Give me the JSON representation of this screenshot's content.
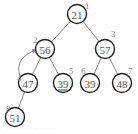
{
  "diagram": {
    "type": "binary-heap",
    "nodes": [
      {
        "index": "1",
        "value": "21",
        "x": 77,
        "y": 14,
        "lx": 85,
        "ly": 9
      },
      {
        "index": "2",
        "value": "56",
        "x": 45,
        "y": 49,
        "lx": 33,
        "ly": 43
      },
      {
        "index": "3",
        "value": "57",
        "x": 105,
        "y": 49,
        "lx": 111,
        "ly": 37
      },
      {
        "index": "4",
        "value": "47",
        "x": 28,
        "y": 83,
        "lx": 17,
        "ly": 81
      },
      {
        "index": "5",
        "value": "39",
        "x": 63,
        "y": 83,
        "lx": 69,
        "ly": 74,
        "underline": true
      },
      {
        "index": "6",
        "value": "39",
        "x": 90,
        "y": 83,
        "lx": 81,
        "ly": 74
      },
      {
        "index": "7",
        "value": "48",
        "x": 122,
        "y": 83,
        "lx": 128,
        "ly": 74
      },
      {
        "index": "8",
        "value": "51",
        "x": 15,
        "y": 117,
        "lx": 6,
        "ly": 112
      }
    ],
    "edges": [
      [
        0,
        1
      ],
      [
        0,
        2
      ],
      [
        1,
        3
      ],
      [
        1,
        4
      ],
      [
        2,
        5
      ],
      [
        2,
        6
      ],
      [
        3,
        7
      ]
    ],
    "swap_arrow": {
      "from": "4",
      "to": "2"
    },
    "caption": "·· ··· ·· · ··· · ··· ······ ·"
  }
}
